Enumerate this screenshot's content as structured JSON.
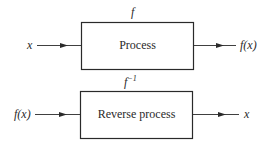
{
  "diagram": {
    "top": {
      "function_label": "f",
      "input_label": "x",
      "box_label": "Process",
      "output_label": "f(x)"
    },
    "bottom": {
      "function_label": "f",
      "function_superscript": "−1",
      "input_label": "f(x)",
      "box_label": "Reverse process",
      "output_label": "x"
    },
    "colors": {
      "stroke": "#2a2a2a",
      "background": "#ffffff"
    }
  }
}
